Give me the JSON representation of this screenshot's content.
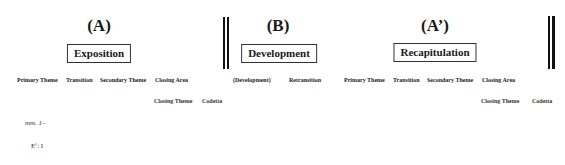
{
  "sections": [
    {
      "letter": "(A)",
      "name": "Exposition"
    },
    {
      "letter": "(B)",
      "name": "Development"
    },
    {
      "letter": "(A’)",
      "name": "Recapitulation"
    }
  ],
  "exposition": {
    "row1": [
      "Primary Theme",
      "Transition",
      "Secondary Theme",
      "Closing Area"
    ],
    "row2": [
      "Closing Theme",
      "Codetta"
    ]
  },
  "development": {
    "row1": [
      "(Development)",
      "Retransition"
    ]
  },
  "recapitulation": {
    "row1": [
      "Primary Theme",
      "Transition",
      "Secondary Theme",
      "Closing Area"
    ],
    "row2": [
      "Closing Theme",
      "Codetta"
    ]
  },
  "annotations": {
    "measures": "mm. 1–",
    "key_letter": "E",
    "key_accidental": "♭",
    "key_rest": ": I"
  }
}
